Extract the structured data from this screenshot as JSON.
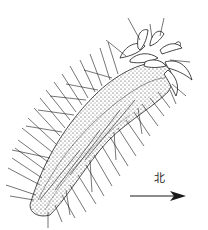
{
  "figure": {
    "ink_color": "#1a1a1a",
    "background": "#ffffff"
  },
  "compass": {
    "label": "北",
    "direction": "right",
    "arrow_icon": "north-arrow-icon"
  }
}
